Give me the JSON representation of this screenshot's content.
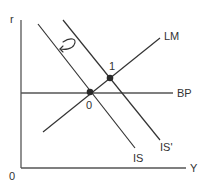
{
  "diagram": {
    "type": "IS-LM-BP",
    "axes": {
      "y_label": "r",
      "x_label": "Y",
      "origin_label": "0"
    },
    "curves": {
      "lm": {
        "label": "LM"
      },
      "bp": {
        "label": "BP"
      },
      "is": {
        "label": "IS"
      },
      "is_shifted": {
        "label": "IS'"
      }
    },
    "points": {
      "initial": {
        "label": "0"
      },
      "new": {
        "label": "1"
      }
    },
    "annotation": {
      "icon": "curved-arrow-icon",
      "meaning": "shift of IS back to the left"
    },
    "colors": {
      "line": "#333333",
      "axis": "#555555",
      "point": "#2a2a2a",
      "background": "#ffffff"
    }
  }
}
